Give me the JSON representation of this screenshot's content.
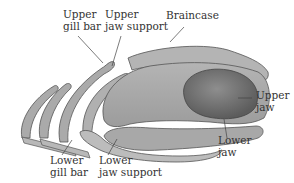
{
  "diagram": {
    "colors": {
      "bone_fill": "#a8a8a8",
      "bone_dark": "#8a8a8a",
      "bone_light": "#c4c4c4",
      "outline": "#555555",
      "eye_socket": "#707070",
      "label_text": "#333333",
      "leader_line": "#444444"
    },
    "labels": {
      "upper_gill_bar": {
        "line1": "Upper",
        "line2": "gill bar"
      },
      "upper_jaw_support": {
        "line1": "Upper",
        "line2": "jaw support"
      },
      "braincase": {
        "line1": "Braincase"
      },
      "upper_jaw": {
        "line1": "Upper",
        "line2": "jaw"
      },
      "lower_jaw": {
        "line1": "Lower",
        "line2": "jaw"
      },
      "lower_gill_bar": {
        "line1": "Lower",
        "line2": "gill bar"
      },
      "lower_jaw_support": {
        "line1": "Lower",
        "line2": "jaw support"
      }
    }
  }
}
